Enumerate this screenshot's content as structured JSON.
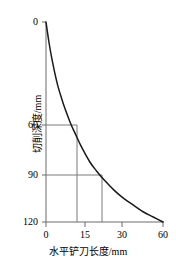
{
  "chart_data": {
    "type": "line",
    "title": "",
    "xlabel": "水平铲刀长度/mm",
    "ylabel": "切削深度/mm",
    "xlim": [
      0,
      60
    ],
    "ylim": [
      0,
      120
    ],
    "y_inverted": true,
    "grid": false,
    "legend": "none",
    "xticks": [
      0,
      15,
      30,
      60
    ],
    "xtick_labels": [
      "0",
      "15",
      "30",
      "60"
    ],
    "yticks": [
      0,
      60,
      90,
      120
    ],
    "ytick_labels": [
      "0",
      "60",
      "90",
      "120"
    ],
    "series": [
      {
        "name": "切削深度曲线",
        "x": [
          0,
          1.5,
          3,
          4.5,
          6,
          7.5,
          9,
          11,
          13,
          15,
          18,
          22.5,
          26,
          30,
          35,
          40,
          45,
          50,
          55,
          60
        ],
        "values": [
          0,
          12,
          22,
          30.5,
          38,
          44,
          49.5,
          56,
          62,
          67,
          74.5,
          84,
          89.5,
          95,
          101,
          106,
          110,
          114,
          117,
          120
        ]
      }
    ],
    "annotations": [
      {
        "name": "guide-60",
        "type": "guide-lines",
        "depth": 60,
        "length": 12,
        "description": "切削深度 60 mm 对应水平铲刀长度约 12 mm"
      },
      {
        "name": "guide-90",
        "type": "guide-lines",
        "depth": 90,
        "length": 22.5,
        "description": "切削深度 90 mm 对应水平铲刀长度约 22.5 mm"
      }
    ],
    "colors": {
      "curve": "#1a1a1a",
      "axis": "#6b6b6b",
      "guide": "#7a7a7a",
      "background": "#ffffff",
      "text": "#000000"
    }
  }
}
